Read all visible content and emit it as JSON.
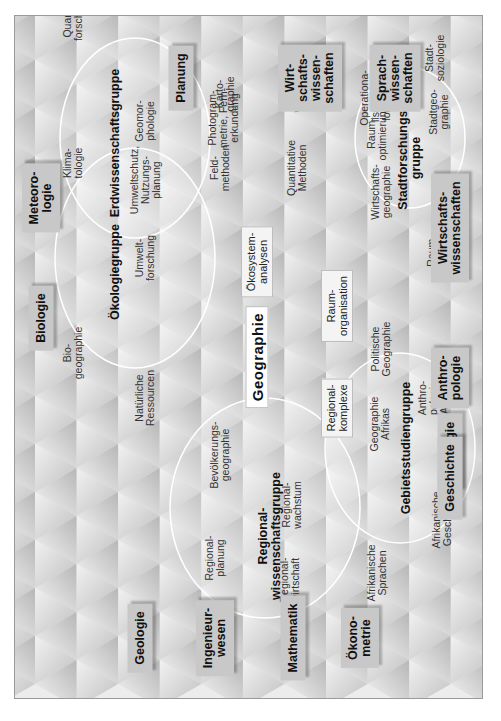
{
  "center": "Geographie",
  "groups": [
    {
      "id": "oekologie",
      "label": "Ökologiegruppe"
    },
    {
      "id": "erdwissenschaft",
      "label": "Erdwissenschaftsgruppe"
    },
    {
      "id": "regional",
      "label": "Regional-\nwissenschaftsgruppe"
    },
    {
      "id": "gebietsstudien",
      "label": "Gebietsstudiengruppe"
    },
    {
      "id": "stadtforschung",
      "label": "Stadtforschungs-\ngruppe"
    }
  ],
  "inner_boxes": [
    {
      "id": "oekosystem",
      "label": "Ökosystem-\nanalysen"
    },
    {
      "id": "regionalkomplexe",
      "label": "Regional-\nkomplexe"
    },
    {
      "id": "raumorganisation",
      "label": "Raum-\norganisation"
    }
  ],
  "subfields": [
    {
      "id": "umweltschutz",
      "label": "Umweltschutz,\nNutzungs-\nplanung"
    },
    {
      "id": "regionalplanung",
      "label": "Regional-\nplanung"
    },
    {
      "id": "regionalwirtschaft",
      "label": "Regional-\nwirtschaft"
    },
    {
      "id": "afr-sprachen",
      "label": "Afrikanische\nSprachen"
    },
    {
      "id": "bevoelkerung",
      "label": "Bevölkerungs-\ngeographie"
    },
    {
      "id": "regionalwachstum",
      "label": "Regional-\nwachstum"
    },
    {
      "id": "afr-geschichte",
      "label": "Afrikanische\nGeschichte"
    },
    {
      "id": "biogeographie",
      "label": "Bio-\ngeographie"
    },
    {
      "id": "natuerliche",
      "label": "Natürliche\nRessourcen"
    },
    {
      "id": "geo-afrikas",
      "label": "Geographie\nAfrikas"
    },
    {
      "id": "anthro-afrikas",
      "label": "Anthro-\npologie\nAfrikas"
    },
    {
      "id": "klimatologie",
      "label": "Klima-\ntologie"
    },
    {
      "id": "umweltforschung",
      "label": "Umwelt-\nforschung"
    },
    {
      "id": "politische",
      "label": "Politische\nGeographie"
    },
    {
      "id": "raumstruktur",
      "label": "Raum-\nstruktur-\ntheorie"
    },
    {
      "id": "geomorphologie",
      "label": "Geomor-\nphologie"
    },
    {
      "id": "feldmethoden",
      "label": "Feld-\nmethoden"
    },
    {
      "id": "wirtschaftsgeo",
      "label": "Wirtschafts-\ngeographie"
    },
    {
      "id": "quartaer",
      "label": "Quartär-\nforschung"
    },
    {
      "id": "kartographie",
      "label": "Karto-\ngraphie"
    },
    {
      "id": "quantitative",
      "label": "Quantitative\nMethoden"
    },
    {
      "id": "raumoptimierung",
      "label": "Raum-\noptimierung"
    },
    {
      "id": "stadtgeo",
      "label": "Stadtgeo-\ngraphie"
    },
    {
      "id": "photogrammetrie",
      "label": "Photogram-\nmetrie, Fern-\nerkundung"
    },
    {
      "id": "statistiken",
      "label": "Statistiken,\nWahrschein-\nlichkeits-\nrechnung"
    },
    {
      "id": "operationalisierung",
      "label": "Operationa-\nlisierungs-\nforschung"
    },
    {
      "id": "stadtsoziologie",
      "label": "Stadt-\nsoziologie"
    }
  ],
  "disciplines": [
    {
      "id": "planung",
      "label": "Planung"
    },
    {
      "id": "wirtschaftswiss-top",
      "label": "Wirt-\nschafts-\nwissen-\nschaften"
    },
    {
      "id": "sprachwiss",
      "label": "Sprach-\nwissen-\nschaften"
    },
    {
      "id": "biologie",
      "label": "Biologie"
    },
    {
      "id": "meteorologie",
      "label": "Meteoro-\nlogie"
    },
    {
      "id": "geologie",
      "label": "Geologie"
    },
    {
      "id": "ingenieurwesen",
      "label": "Ingenieur-\nwesen"
    },
    {
      "id": "mathematik",
      "label": "Mathematik"
    },
    {
      "id": "oekonometrie",
      "label": "Ökono-\nmetrie"
    },
    {
      "id": "soziologie",
      "label": "Soziologie"
    },
    {
      "id": "wirtschaftswiss-bottom",
      "label": "Wirtschafts-\nwissenschaften"
    },
    {
      "id": "anthropologie",
      "label": "Anthro-\npologie"
    },
    {
      "id": "geschichte",
      "label": "Geschichte"
    }
  ]
}
